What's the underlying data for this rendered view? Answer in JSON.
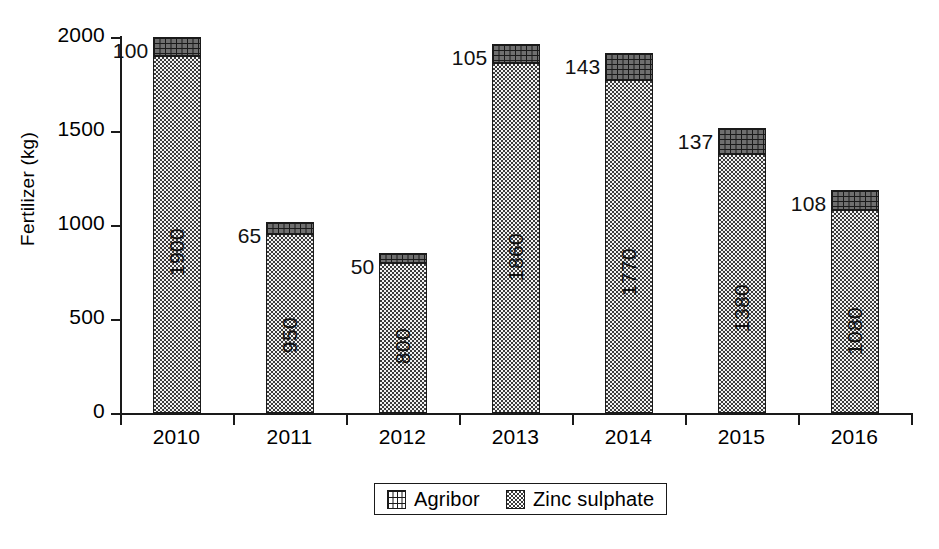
{
  "chart_data": {
    "type": "bar",
    "subtype": "stacked-vertical",
    "title": "",
    "xlabel": "",
    "ylabel": "Fertilizer (kg)",
    "categories": [
      "2010",
      "2011",
      "2012",
      "2013",
      "2014",
      "2015",
      "2016"
    ],
    "series": [
      {
        "name": "Zinc sulphate",
        "pattern": "fine-dotted",
        "values": [
          1900,
          950,
          800,
          1860,
          1770,
          1380,
          1080
        ],
        "labels": [
          "1900",
          "950",
          "800",
          "1860",
          "1770",
          "1380",
          "1080"
        ],
        "label_position": "inside-rotated"
      },
      {
        "name": "Agribor",
        "pattern": "brick-hatch",
        "values": [
          100,
          65,
          50,
          105,
          143,
          137,
          108
        ],
        "labels": [
          "100",
          "65",
          "50",
          "105",
          "143",
          "137",
          "108"
        ],
        "label_position": "outside-left-of-top"
      }
    ],
    "totals": [
      2000,
      1015,
      850,
      1965,
      1913,
      1517,
      1188
    ],
    "ylim": [
      0,
      2000
    ],
    "yticks": [
      0,
      500,
      1000,
      1500,
      2000
    ],
    "ytick_labels": [
      "0",
      "500",
      "1000",
      "1500",
      "2000"
    ],
    "grid": false,
    "legend": {
      "position": "bottom-center",
      "boxed": true,
      "entries": [
        {
          "label": "Agribor",
          "swatch": "brick-hatch-swatch"
        },
        {
          "label": "Zinc sulphate",
          "swatch": "fine-dotted-swatch"
        }
      ]
    },
    "colors": {
      "axis": "#1a1a1a",
      "text": "#000000",
      "zinc_fill": "#f2f2f2",
      "agribor_fill": "#6f6f6f",
      "background": "#ffffff"
    }
  }
}
